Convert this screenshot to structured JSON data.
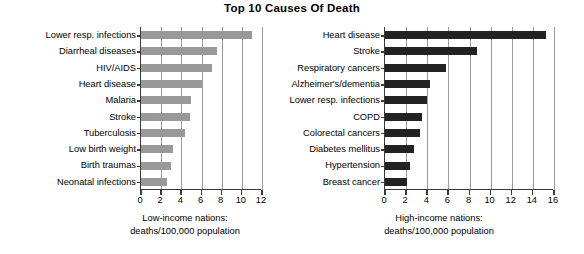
{
  "chart_data": [
    {
      "type": "bar",
      "orientation": "horizontal",
      "title": "Top 10 Causes Of Death",
      "panel": "left",
      "xlabel": "Low-income nations: deaths/100,000 population",
      "xlabel_lines": [
        "Low-income nations:",
        "deaths/100,000 population"
      ],
      "ylabel": "",
      "categories": [
        "Lower resp. infections",
        "Diarrheal diseases",
        "HIV/AIDS",
        "Heart disease",
        "Malaria",
        "Stroke",
        "Tuberculosis",
        "Low birth weight",
        "Birth traumas",
        "Neonatal infections"
      ],
      "values": [
        11.0,
        7.5,
        7.0,
        6.0,
        5.0,
        4.9,
        4.4,
        3.2,
        3.0,
        2.6
      ],
      "xlim": [
        0,
        12
      ],
      "xticks": [
        0,
        2,
        4,
        6,
        8,
        10,
        12
      ],
      "xticklabels": [
        "0",
        "2",
        "4",
        "6",
        "8",
        "10",
        "12"
      ],
      "grid": "vertical",
      "bar_color": "#999999",
      "legend": "none"
    },
    {
      "type": "bar",
      "orientation": "horizontal",
      "title": "Top 10 Causes Of Death",
      "panel": "right",
      "xlabel": "High-income nations: deaths/100,000 population",
      "xlabel_lines": [
        "High-income nations:",
        "deaths/100,000 population"
      ],
      "ylabel": "",
      "categories": [
        "Heart disease",
        "Stroke",
        "Respiratory cancers",
        "Alzheimer's/dementia",
        "Lower resp. infections",
        "COPD",
        "Colorectal cancers",
        "Diabetes mellitus",
        "Hypertension",
        "Breast cancer"
      ],
      "values": [
        15.2,
        8.7,
        5.8,
        4.3,
        4.0,
        3.5,
        3.3,
        2.7,
        2.4,
        2.1
      ],
      "xlim": [
        0,
        16
      ],
      "xticks": [
        0,
        2,
        4,
        6,
        8,
        10,
        12,
        14,
        16
      ],
      "xticklabels": [
        "0",
        "2",
        "4",
        "6",
        "8",
        "10",
        "12",
        "14",
        "16"
      ],
      "grid": "vertical",
      "bar_color": "#222222",
      "legend": "none"
    }
  ],
  "figure": {
    "title": "Top 10 Causes Of Death",
    "background": "#ffffff",
    "axis_color": "#3a3a3a",
    "grid_color": "#9a9a9a"
  }
}
